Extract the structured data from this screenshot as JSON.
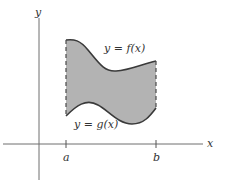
{
  "figure": {
    "x_axis_label": "x",
    "y_axis_label": "y",
    "tick_a_label": "a",
    "tick_b_label": "b",
    "upper_curve_label": "y = f(x)",
    "lower_curve_label": "y = g(x)",
    "colors": {
      "region_fill": "#b3b3b3",
      "curve_stroke": "#3a3a3a",
      "axis_stroke": "#6e6e6e",
      "background": "#ffffff"
    }
  }
}
